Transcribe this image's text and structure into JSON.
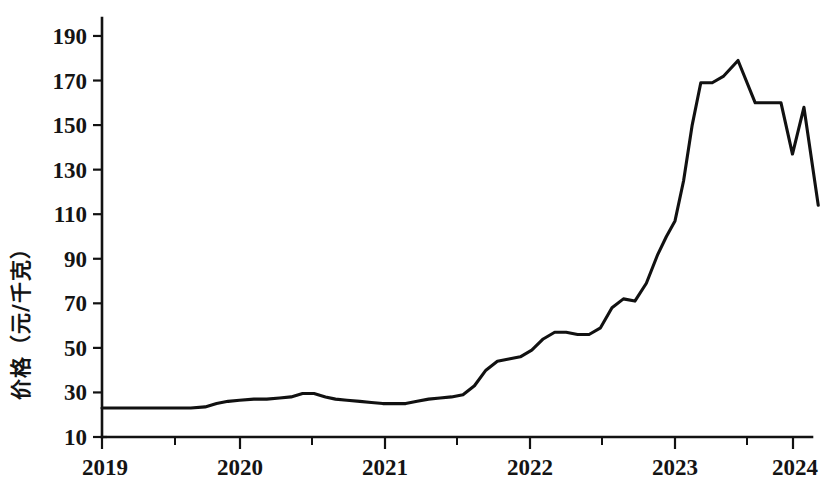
{
  "chart_data": {
    "type": "line",
    "title": "",
    "subtitle": "",
    "xlabel": "",
    "ylabel": "价格（元/千克）",
    "ylabel_translation": "Price (yuan/kg)",
    "grid": false,
    "legend": null,
    "legend_position": "none",
    "xlim": [
      2019.0,
      2024.1
    ],
    "ylim": [
      10,
      200
    ],
    "y_ticks": [
      10,
      30,
      50,
      70,
      90,
      110,
      130,
      150,
      170,
      190
    ],
    "y_tick_labels": [
      "10",
      "30",
      "50",
      "70",
      "90",
      "110",
      "130",
      "150",
      "170",
      "190"
    ],
    "x_ticks": [
      2019,
      2020,
      2021,
      2022,
      2023,
      2024
    ],
    "x_tick_labels": [
      "2019",
      "2020",
      "2021",
      "2022",
      "2023",
      "2024"
    ],
    "x_minor_ticks": [
      2019.5,
      2020.5,
      2021.5,
      2022.5,
      2023.5
    ],
    "series": [
      {
        "name": "价格",
        "color": "#111111",
        "x": [
          2019.0,
          2019.12,
          2019.25,
          2019.37,
          2019.5,
          2019.62,
          2019.72,
          2019.8,
          2019.88,
          2019.96,
          2020.06,
          2020.15,
          2020.24,
          2020.32,
          2020.4,
          2020.48,
          2020.56,
          2020.63,
          2020.71,
          2020.8,
          2020.88,
          2020.96,
          2021.04,
          2021.12,
          2021.2,
          2021.28,
          2021.36,
          2021.44,
          2021.52,
          2021.6,
          2021.68,
          2021.76,
          2021.84,
          2021.92,
          2022.0,
          2022.08,
          2022.16,
          2022.24,
          2022.32,
          2022.4,
          2022.48,
          2022.56,
          2022.64,
          2022.72,
          2022.8,
          2022.88,
          2022.94,
          2023.0,
          2023.06,
          2023.12,
          2023.18,
          2023.26,
          2023.34,
          2023.44,
          2023.56,
          2023.66,
          2023.74,
          2023.82,
          2023.9,
          2024.0
        ],
        "y": [
          23,
          23,
          23,
          23,
          23,
          23,
          23.5,
          25,
          26,
          26.5,
          27,
          27,
          27.5,
          28,
          29.5,
          29.5,
          28,
          27,
          26.5,
          26,
          25.5,
          25,
          25,
          25,
          26,
          27,
          27.5,
          28,
          29,
          33,
          40,
          44,
          45,
          46,
          49,
          54,
          57,
          57,
          56,
          56,
          59,
          68,
          72,
          71,
          79,
          92,
          100,
          107,
          125,
          150,
          169,
          169,
          172,
          179,
          160,
          160,
          160,
          137,
          158,
          114
        ]
      }
    ],
    "annotations": [],
    "notable_points": {
      "baseline_2019": 23,
      "peak_value": 179,
      "peak_x": 2023.44,
      "dip_value": 137,
      "dip_x": 2023.82,
      "final_value": 114,
      "final_x": 2024.0
    }
  },
  "geometry": {
    "plot_left": 102,
    "plot_right": 812,
    "axis_bottom_y": 437,
    "axis_top_y": 18,
    "y_value_at_bottom": 10,
    "y_value_at_190": 36,
    "px_per_unit_y": 2.228,
    "year_tick_px": [
      102,
      240,
      385,
      530,
      675,
      793
    ],
    "half_tick_px": [
      175,
      312,
      457,
      602,
      747
    ]
  }
}
